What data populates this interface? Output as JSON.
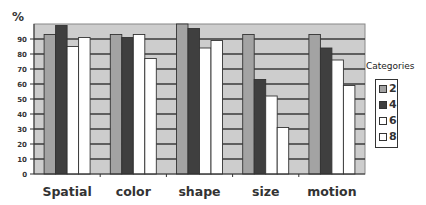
{
  "chart_data": {
    "type": "bar",
    "title": "",
    "xlabel": "",
    "ylabel": "%",
    "ylim": [
      0,
      100
    ],
    "yticks": [
      0,
      10,
      20,
      30,
      40,
      50,
      60,
      70,
      80,
      90
    ],
    "grid": true,
    "legend_title": "Categories",
    "legend_position": "right",
    "categories": [
      "Spatial",
      "color",
      "shape",
      "size",
      "motion"
    ],
    "series": [
      {
        "name": "2",
        "color": "#a3a3a3",
        "values": [
          93,
          93,
          100,
          93,
          93
        ]
      },
      {
        "name": "4",
        "color": "#3f3f3f",
        "values": [
          99,
          91,
          97,
          63,
          84
        ]
      },
      {
        "name": "6",
        "color": "#ffffff",
        "values": [
          85,
          93,
          84,
          52,
          76
        ]
      },
      {
        "name": "8",
        "color": "#ffffff",
        "values": [
          91,
          77,
          89,
          31,
          59
        ]
      }
    ]
  },
  "colors": {
    "plot_background": "#cdcdcd",
    "gridline": "#3a3a3a",
    "axis": "#333333"
  }
}
